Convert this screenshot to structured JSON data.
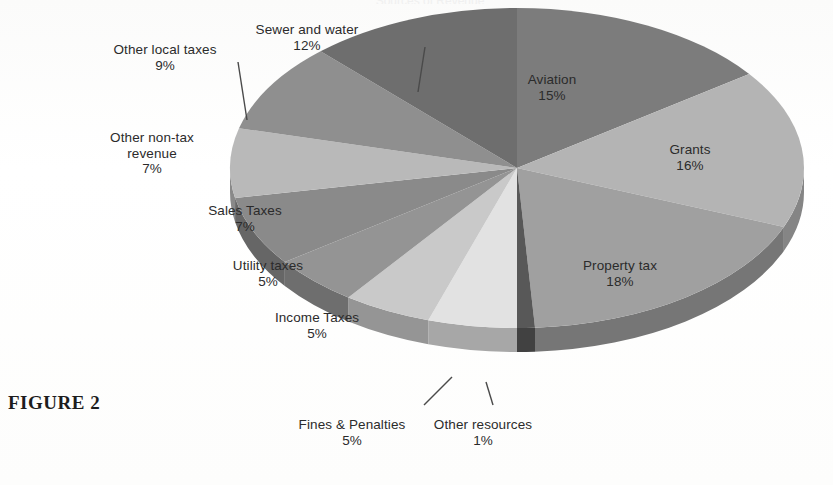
{
  "figure": {
    "caption": "FIGURE 2",
    "clipped_title": "Sources of Revenue"
  },
  "colors": {
    "background": "#fdfdfd",
    "text": "#2b2b2b",
    "leader_line": "#4a4a4a"
  },
  "chart_data": {
    "type": "pie",
    "title": "",
    "xlabel": "",
    "ylabel": "",
    "legend_position": "none",
    "labels_inline": true,
    "start_angle_deg": 0,
    "direction": "clockwise",
    "three_d": true,
    "categories": [
      "Aviation",
      "Grants",
      "Property tax",
      "Other resources",
      "Fines & Penalties",
      "Income Taxes",
      "Utility taxes",
      "Sales Taxes",
      "Other non-tax revenue",
      "Other local taxes",
      "Sewer and water"
    ],
    "values": [
      15,
      16,
      18,
      1,
      5,
      5,
      5,
      7,
      7,
      9,
      12
    ],
    "value_labels": [
      "15%",
      "16%",
      "18%",
      "1%",
      "5%",
      "5%",
      "5%",
      "7%",
      "7%",
      "9%",
      "12%"
    ],
    "unit": "%",
    "slice_colors": [
      "#7c7c7c",
      "#b4b4b4",
      "#a0a0a0",
      "#585858",
      "#e2e2e2",
      "#c9c9c9",
      "#949494",
      "#8a8a8a",
      "#b9b9b9",
      "#8f8f8f",
      "#6e6e6e"
    ]
  },
  "slices": [
    {
      "name": "Aviation",
      "label": "Aviation",
      "percent": "15%",
      "label_x": 552,
      "label_y": 72,
      "leader": false
    },
    {
      "name": "Grants",
      "label": "Grants",
      "percent": "16%",
      "label_x": 690,
      "label_y": 142,
      "leader": false
    },
    {
      "name": "Property tax",
      "label": "Property tax",
      "percent": "18%",
      "label_x": 620,
      "label_y": 258,
      "leader": false
    },
    {
      "name": "Other resources",
      "label": "Other resources",
      "percent": "1%",
      "label_x": 483,
      "label_y": 417,
      "leader": true
    },
    {
      "name": "Fines & Penalties",
      "label": "Fines & Penalties",
      "percent": "5%",
      "label_x": 352,
      "label_y": 417,
      "leader": true
    },
    {
      "name": "Income Taxes",
      "label": "Income Taxes",
      "percent": "5%",
      "label_x": 317,
      "label_y": 310,
      "leader": false
    },
    {
      "name": "Utility taxes",
      "label": "Utility taxes",
      "percent": "5%",
      "label_x": 268,
      "label_y": 258,
      "leader": false
    },
    {
      "name": "Sales Taxes",
      "label": "Sales Taxes",
      "percent": "7%",
      "label_x": 245,
      "label_y": 203,
      "leader": false
    },
    {
      "name": "Other non-tax revenue",
      "label": "Other non-tax\nrevenue",
      "percent": "7%",
      "label_x": 152,
      "label_y": 130,
      "leader": false
    },
    {
      "name": "Other local taxes",
      "label": "Other local taxes",
      "percent": "9%",
      "label_x": 165,
      "label_y": 42,
      "leader": true
    },
    {
      "name": "Sewer and water",
      "label": "Sewer and water",
      "percent": "12%",
      "label_x": 307,
      "label_y": 22,
      "leader": true
    }
  ]
}
